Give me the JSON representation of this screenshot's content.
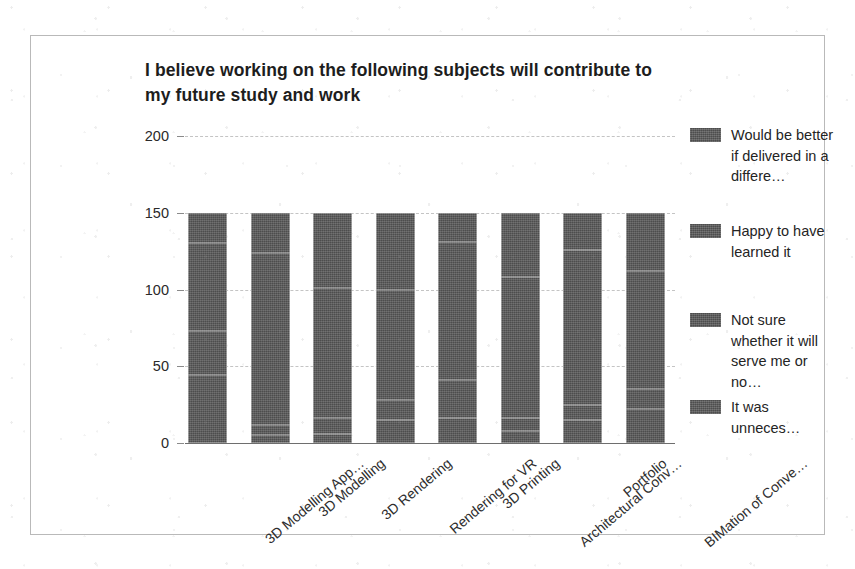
{
  "chart_data": {
    "type": "bar",
    "subtype": "stacked-bar-vertical",
    "title": "I believe working on the following subjects will contribute to my future study and work",
    "xlabel": "",
    "ylabel": "",
    "ylim": [
      0,
      200
    ],
    "yticks": [
      0,
      50,
      100,
      150,
      200
    ],
    "ytick_labels": [
      "0",
      "50",
      "100",
      "150",
      "200"
    ],
    "grid": true,
    "grid_axis": "y",
    "legend_position": "right",
    "categories": [
      "3D Modelling App…",
      "3D Modelling",
      "3D Rendering",
      "Rendering for VR",
      "3D Printing",
      "Architectural Conv…",
      "Portfolio",
      "BIMation of Conve…"
    ],
    "series": [
      {
        "name": "It was unneces…",
        "color": "#585858",
        "values": [
          44,
          5,
          6,
          15,
          16,
          8,
          15,
          22
        ]
      },
      {
        "name": "Not sure whether it will serve me or no…",
        "color": "#585858",
        "values": [
          29,
          7,
          10,
          13,
          25,
          8,
          10,
          13
        ]
      },
      {
        "name": "Happy to have learned it",
        "color": "#585858",
        "values": [
          57,
          112,
          85,
          72,
          90,
          92,
          101,
          77
        ]
      },
      {
        "name": "Would be better if delivered in a differe…",
        "color": "#585858",
        "values": [
          20,
          26,
          49,
          50,
          19,
          42,
          24,
          38
        ]
      }
    ],
    "stack_totals": [
      150,
      150,
      150,
      150,
      150,
      150,
      150,
      150
    ]
  },
  "legend": {
    "entries": [
      {
        "label": "Would be better if delivered in a differe…",
        "color": "#585858"
      },
      {
        "label": "Happy to have learned it",
        "color": "#585858"
      },
      {
        "label": "Not sure whether it will serve me or no…",
        "color": "#585858"
      },
      {
        "label": "It was unneces…",
        "color": "#585858"
      }
    ]
  },
  "style": {
    "bar_color": "#585858",
    "frame_color": "#b9b9b9",
    "grid_color": "#c4c4c4",
    "text_color": "#242424",
    "background": "#ffffff"
  }
}
